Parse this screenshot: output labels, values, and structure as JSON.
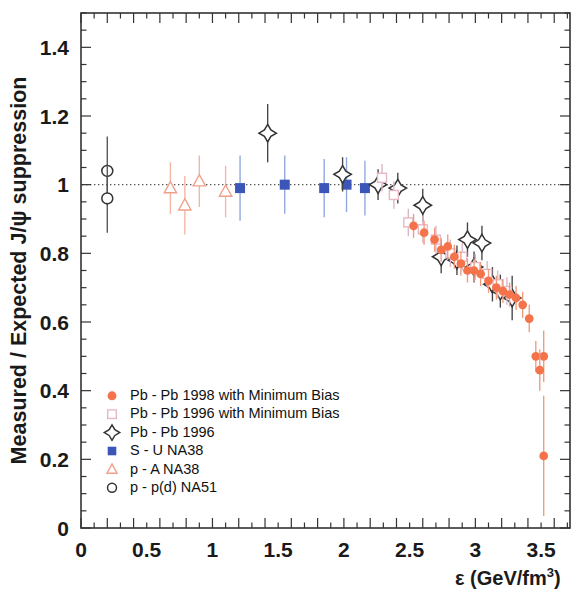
{
  "figure": {
    "ylabel": "Measured / Expected  J/ψ suppression",
    "xlabel_symbol": "ε",
    "xlabel_units": "(GeV/fm",
    "xlabel_exp": "3",
    "xlabel_close": ")"
  },
  "axes": {
    "x_ticklabels": [
      "0",
      "0.5",
      "1",
      "1.5",
      "2",
      "2.5",
      "3",
      "3.5"
    ],
    "x_tickvalues": [
      0,
      0.5,
      1,
      1.5,
      2,
      2.5,
      3,
      3.5
    ],
    "y_ticklabels": [
      "0",
      "0.2",
      "0.4",
      "0.6",
      "0.8",
      "1",
      "1.2",
      "1.4"
    ],
    "y_tickvalues": [
      0,
      0.2,
      0.4,
      0.6,
      0.8,
      1,
      1.2,
      1.4
    ]
  },
  "legend": {
    "items": [
      {
        "marker": "filled-circle",
        "color": "#f4734a",
        "label": "Pb - Pb 1998 with Minimum Bias"
      },
      {
        "marker": "open-square",
        "color": "#e8b7c4",
        "label": "Pb - Pb 1996 with Minimum Bias"
      },
      {
        "marker": "open-diamond",
        "color": "#333333",
        "label": "Pb - Pb 1996"
      },
      {
        "marker": "filled-square",
        "color": "#3b56b8",
        "label": "S - U     NA38"
      },
      {
        "marker": "open-triangle",
        "color": "#f0a08a",
        "label": "p - A     NA38"
      },
      {
        "marker": "open-circle",
        "color": "#333333",
        "label": "p - p(d)  NA51"
      }
    ]
  },
  "colors": {
    "pbpb98": "#f4734a",
    "pbpb96mb": "#e8b7c4",
    "pbpb96": "#333333",
    "su": "#3b56b8",
    "pa": "#f0a08a",
    "pp": "#333333",
    "frame": "#333333",
    "unity_line": "#555555"
  },
  "chart_data": {
    "type": "scatter",
    "title": "",
    "xlabel": "ε (GeV/fm^3)",
    "ylabel": "Measured / Expected J/ψ suppression",
    "xlim": [
      0,
      3.72
    ],
    "ylim": [
      0,
      1.5
    ],
    "grid": false,
    "reference_line": {
      "y": 1.0,
      "style": "dotted"
    },
    "legend_position": "lower-left-inside",
    "series": [
      {
        "name": "p - p(d)  NA51",
        "marker": "open-circle",
        "color": "#333333",
        "points": [
          {
            "x": 0.2,
            "y": 1.04,
            "yerr": 0.1
          },
          {
            "x": 0.2,
            "y": 0.96,
            "yerr": 0.1
          }
        ]
      },
      {
        "name": "p - A     NA38",
        "marker": "open-triangle",
        "color": "#f0a08a",
        "points": [
          {
            "x": 0.68,
            "y": 0.99,
            "yerr": 0.075
          },
          {
            "x": 0.79,
            "y": 0.94,
            "yerr": 0.085
          },
          {
            "x": 0.9,
            "y": 1.01,
            "yerr": 0.075
          },
          {
            "x": 1.1,
            "y": 0.98,
            "yerr": 0.075
          }
        ]
      },
      {
        "name": "S - U     NA38",
        "marker": "filled-square",
        "color": "#3b56b8",
        "points": [
          {
            "x": 1.21,
            "y": 0.99,
            "yerr": 0.095
          },
          {
            "x": 1.55,
            "y": 1.0,
            "yerr": 0.085
          },
          {
            "x": 1.85,
            "y": 0.99,
            "yerr": 0.085
          },
          {
            "x": 2.02,
            "y": 1.0,
            "yerr": 0.08
          },
          {
            "x": 2.16,
            "y": 0.99,
            "yerr": 0.08
          }
        ]
      },
      {
        "name": "Pb - Pb 1996",
        "marker": "open-diamond",
        "color": "#333333",
        "points": [
          {
            "x": 1.42,
            "y": 1.15,
            "yerr": 0.085
          },
          {
            "x": 1.99,
            "y": 1.03,
            "yerr": 0.05
          },
          {
            "x": 2.26,
            "y": 1.0,
            "yerr": 0.045
          },
          {
            "x": 2.41,
            "y": 0.99,
            "yerr": 0.045
          },
          {
            "x": 2.6,
            "y": 0.94,
            "yerr": 0.048
          },
          {
            "x": 2.74,
            "y": 0.79,
            "yerr": 0.048
          },
          {
            "x": 2.86,
            "y": 0.78,
            "yerr": 0.043
          },
          {
            "x": 2.94,
            "y": 0.84,
            "yerr": 0.05
          },
          {
            "x": 2.99,
            "y": 0.76,
            "yerr": 0.045
          },
          {
            "x": 3.05,
            "y": 0.83,
            "yerr": 0.05
          },
          {
            "x": 3.13,
            "y": 0.71,
            "yerr": 0.05
          },
          {
            "x": 3.19,
            "y": 0.69,
            "yerr": 0.048
          },
          {
            "x": 3.28,
            "y": 0.67,
            "yerr": 0.065
          }
        ]
      },
      {
        "name": "Pb - Pb 1996 with Minimum Bias",
        "marker": "open-square",
        "color": "#e8b7c4",
        "points": [
          {
            "x": 2.29,
            "y": 1.02,
            "yerr": 0.04
          },
          {
            "x": 2.38,
            "y": 0.97,
            "yerr": 0.04
          },
          {
            "x": 2.49,
            "y": 0.89,
            "yerr": 0.04
          },
          {
            "x": 2.6,
            "y": 0.87,
            "yerr": 0.04
          },
          {
            "x": 2.7,
            "y": 0.84,
            "yerr": 0.04
          },
          {
            "x": 2.81,
            "y": 0.8,
            "yerr": 0.04
          },
          {
            "x": 2.9,
            "y": 0.79,
            "yerr": 0.04
          },
          {
            "x": 3.0,
            "y": 0.76,
            "yerr": 0.038
          },
          {
            "x": 3.09,
            "y": 0.74,
            "yerr": 0.038
          },
          {
            "x": 3.17,
            "y": 0.71,
            "yerr": 0.04
          },
          {
            "x": 3.24,
            "y": 0.69,
            "yerr": 0.04
          }
        ]
      },
      {
        "name": "Pb - Pb 1998 with Minimum Bias",
        "marker": "filled-circle",
        "color": "#f4734a",
        "points": [
          {
            "x": 2.53,
            "y": 0.88,
            "yerr": 0.035
          },
          {
            "x": 2.61,
            "y": 0.86,
            "yerr": 0.035
          },
          {
            "x": 2.69,
            "y": 0.84,
            "yerr": 0.035
          },
          {
            "x": 2.74,
            "y": 0.81,
            "yerr": 0.035
          },
          {
            "x": 2.79,
            "y": 0.82,
            "yerr": 0.035
          },
          {
            "x": 2.84,
            "y": 0.79,
            "yerr": 0.035
          },
          {
            "x": 2.89,
            "y": 0.77,
            "yerr": 0.035
          },
          {
            "x": 2.94,
            "y": 0.75,
            "yerr": 0.035
          },
          {
            "x": 2.99,
            "y": 0.75,
            "yerr": 0.035
          },
          {
            "x": 3.04,
            "y": 0.74,
            "yerr": 0.035
          },
          {
            "x": 3.1,
            "y": 0.72,
            "yerr": 0.035
          },
          {
            "x": 3.16,
            "y": 0.7,
            "yerr": 0.035
          },
          {
            "x": 3.21,
            "y": 0.69,
            "yerr": 0.035
          },
          {
            "x": 3.26,
            "y": 0.68,
            "yerr": 0.035
          },
          {
            "x": 3.31,
            "y": 0.67,
            "yerr": 0.035
          },
          {
            "x": 3.36,
            "y": 0.65,
            "yerr": 0.038
          },
          {
            "x": 3.41,
            "y": 0.61,
            "yerr": 0.04
          },
          {
            "x": 3.46,
            "y": 0.5,
            "yerr": 0.045
          },
          {
            "x": 3.52,
            "y": 0.5,
            "yerr": 0.075
          },
          {
            "x": 3.49,
            "y": 0.46,
            "yerr": 0.06
          },
          {
            "x": 3.52,
            "y": 0.21,
            "yerr": 0.175
          }
        ]
      }
    ]
  }
}
